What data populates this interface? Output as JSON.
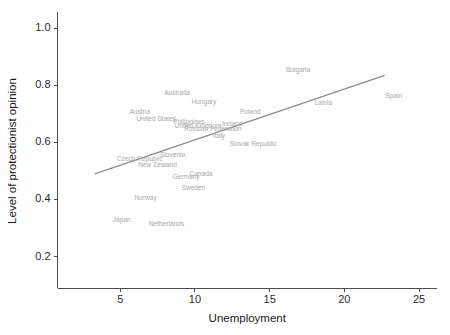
{
  "chart_data": {
    "type": "scatter",
    "title": "",
    "xlabel": "Unemployment",
    "ylabel": "Level of protectionist opinion",
    "xlim": [
      0.8,
      26.2
    ],
    "ylim": [
      0.09,
      1.05
    ],
    "xticks": [
      5,
      10,
      15,
      20,
      25
    ],
    "xticklabels": [
      "5",
      "10",
      "15",
      "20",
      "25"
    ],
    "yticks": [
      0.2,
      0.4,
      0.6,
      0.8,
      1.0
    ],
    "yticklabels": [
      "0.2",
      "0.4",
      "0.6",
      "0.8",
      "1.0"
    ],
    "grid": false,
    "legend": false,
    "marker_style": "text-labels-only",
    "label_color": "#a8a8a8",
    "line_color": "#8a8a8a",
    "axis_color": "#4d4d4d",
    "points": [
      {
        "label": "Bulgaria",
        "x": 16.9,
        "y": 0.853
      },
      {
        "label": "Spain",
        "x": 23.3,
        "y": 0.762
      },
      {
        "label": "Australia",
        "x": 8.8,
        "y": 0.772
      },
      {
        "label": "Hungary",
        "x": 10.6,
        "y": 0.742
      },
      {
        "label": "Latvia",
        "x": 18.6,
        "y": 0.737
      },
      {
        "label": "Austria",
        "x": 6.3,
        "y": 0.705
      },
      {
        "label": "Poland",
        "x": 13.7,
        "y": 0.706
      },
      {
        "label": "United States",
        "x": 7.4,
        "y": 0.68
      },
      {
        "label": "Philippines",
        "x": 9.6,
        "y": 0.672
      },
      {
        "label": "United Kingdom",
        "x": 10.2,
        "y": 0.657
      },
      {
        "label": "Ireland",
        "x": 12.5,
        "y": 0.664
      },
      {
        "label": "Russian Federation",
        "x": 11.2,
        "y": 0.645
      },
      {
        "label": "Italy",
        "x": 11.6,
        "y": 0.622
      },
      {
        "label": "Slovak Republic",
        "x": 13.9,
        "y": 0.592
      },
      {
        "label": "Slovenia",
        "x": 8.5,
        "y": 0.556
      },
      {
        "label": "Czech Republic",
        "x": 6.3,
        "y": 0.54
      },
      {
        "label": "New Zealand",
        "x": 7.5,
        "y": 0.521
      },
      {
        "label": "Canada",
        "x": 10.4,
        "y": 0.489
      },
      {
        "label": "Germany",
        "x": 9.4,
        "y": 0.478
      },
      {
        "label": "Sweden",
        "x": 9.9,
        "y": 0.438
      },
      {
        "label": "Norway",
        "x": 6.7,
        "y": 0.405
      },
      {
        "label": "Japan",
        "x": 5.1,
        "y": 0.328
      },
      {
        "label": "Netherlands",
        "x": 8.1,
        "y": 0.313
      }
    ],
    "fit_line": {
      "name": "linear-fit",
      "x_start": 3.3,
      "y_start": 0.49,
      "x_end": 22.7,
      "y_end": 0.835
    }
  }
}
